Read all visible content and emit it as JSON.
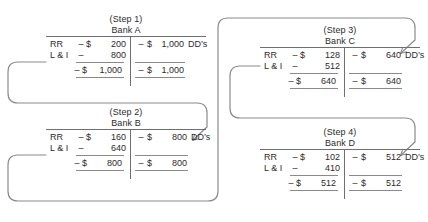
{
  "diagram": {
    "line_color": "#8a8a8a",
    "text_color": "#2b2b2b"
  },
  "labels": {
    "rr": "RR",
    "li": "L & I",
    "minus": "–",
    "dollar": "$",
    "dds": "DD’s"
  },
  "accounts": [
    {
      "step": "(Step 1)",
      "bank": "Bank A",
      "assets": [
        {
          "label": "RR",
          "sign": "–",
          "currency": "$",
          "amount": "200"
        },
        {
          "label": "L & I",
          "sign": "–",
          "currency": "",
          "amount": "800"
        }
      ],
      "assets_total": {
        "sign": "–",
        "currency": "$",
        "amount": "1,000"
      },
      "liabilities": [
        {
          "sign": "–",
          "currency": "$",
          "amount": "1,000",
          "tag": "DD’s"
        }
      ],
      "liabilities_total": {
        "sign": "–",
        "currency": "$",
        "amount": "1,000"
      }
    },
    {
      "step": "(Step 2)",
      "bank": "Bank B",
      "assets": [
        {
          "label": "RR",
          "sign": "–",
          "currency": "$",
          "amount": "160"
        },
        {
          "label": "L & I",
          "sign": "–",
          "currency": "",
          "amount": "640"
        }
      ],
      "assets_total": {
        "sign": "–",
        "currency": "$",
        "amount": "800"
      },
      "liabilities": [
        {
          "sign": "–",
          "currency": "$",
          "amount": "800",
          "tag": "DD’s"
        }
      ],
      "liabilities_total": {
        "sign": "–",
        "currency": "$",
        "amount": "800"
      }
    },
    {
      "step": "(Step 3)",
      "bank": "Bank C",
      "assets": [
        {
          "label": "RR",
          "sign": "–",
          "currency": "$",
          "amount": "128"
        },
        {
          "label": "L & I",
          "sign": "–",
          "currency": "",
          "amount": "512"
        }
      ],
      "assets_total": {
        "sign": "–",
        "currency": "$",
        "amount": "640"
      },
      "liabilities": [
        {
          "sign": "–",
          "currency": "$",
          "amount": "640",
          "tag": "DD’s"
        }
      ],
      "liabilities_total": {
        "sign": "–",
        "currency": "$",
        "amount": "640"
      }
    },
    {
      "step": "(Step 4)",
      "bank": "Bank D",
      "assets": [
        {
          "label": "RR",
          "sign": "–",
          "currency": "$",
          "amount": "102"
        },
        {
          "label": "L & I",
          "sign": "–",
          "currency": "",
          "amount": "410"
        }
      ],
      "assets_total": {
        "sign": "–",
        "currency": "$",
        "amount": "512"
      },
      "liabilities": [
        {
          "sign": "–",
          "currency": "$",
          "amount": "512",
          "tag": "DD’s"
        }
      ],
      "liabilities_total": {
        "sign": "–",
        "currency": "$",
        "amount": "512"
      }
    }
  ],
  "connectors": [
    {
      "name": "step1-to-step2",
      "from": "Bank A",
      "to": "Bank B"
    },
    {
      "name": "step2-to-step3",
      "from": "Bank B",
      "to": "Bank C"
    },
    {
      "name": "step3-to-step4",
      "from": "Bank C",
      "to": "Bank D"
    }
  ]
}
